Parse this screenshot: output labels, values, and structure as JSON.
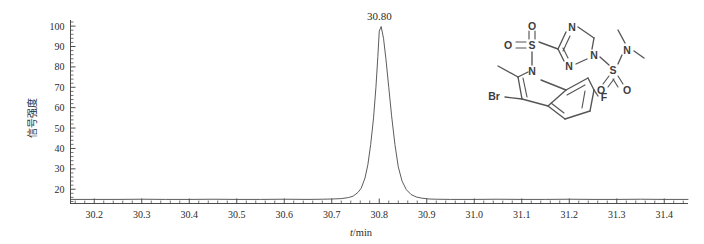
{
  "chart_data": {
    "type": "line",
    "title": "",
    "xlabel": "t/min",
    "ylabel": "信号强度",
    "xlim": [
      30.15,
      31.45
    ],
    "ylim": [
      13,
      103
    ],
    "xticks": [
      "30.2",
      "30.3",
      "30.4",
      "30.5",
      "30.6",
      "30.7",
      "30.8",
      "30.9",
      "31.0",
      "31.1",
      "31.2",
      "31.3",
      "31.4"
    ],
    "xtick_values": [
      30.2,
      30.3,
      30.4,
      30.5,
      30.6,
      30.7,
      30.8,
      30.9,
      31.0,
      31.1,
      31.2,
      31.3,
      31.4
    ],
    "yticks": [
      "20",
      "30",
      "40",
      "50",
      "60",
      "70",
      "80",
      "90",
      "100"
    ],
    "ytick_values": [
      20,
      30,
      40,
      50,
      60,
      70,
      80,
      90,
      100
    ],
    "minor_ticks_per_interval": 5,
    "grid": false,
    "legend": null,
    "annotations": [
      {
        "text": "30.80",
        "x": 30.8,
        "y": 100
      }
    ],
    "peaks": [
      {
        "retention_time": 30.8,
        "height": 100,
        "label": "30.80"
      }
    ],
    "baseline": 15,
    "series": [
      {
        "name": "signal",
        "x": [
          30.15,
          30.2,
          30.25,
          30.3,
          30.35,
          30.4,
          30.45,
          30.5,
          30.55,
          30.6,
          30.65,
          30.68,
          30.7,
          30.72,
          30.735,
          30.745,
          30.755,
          30.762,
          30.77,
          30.776,
          30.782,
          30.788,
          30.793,
          30.797,
          30.8,
          30.804,
          30.809,
          30.814,
          30.82,
          30.826,
          30.833,
          30.84,
          30.848,
          30.857,
          30.867,
          30.878,
          30.89,
          30.905,
          30.92,
          30.95,
          31.0,
          31.05,
          31.1,
          31.15,
          31.2,
          31.25,
          31.3,
          31.35,
          31.4,
          31.45
        ],
        "y": [
          15.0,
          15.0,
          15.0,
          15.1,
          15.0,
          15.0,
          15.1,
          15.0,
          15.0,
          15.1,
          15.0,
          15.1,
          15.2,
          15.4,
          15.9,
          16.6,
          18.4,
          20.5,
          25.5,
          32.0,
          42.0,
          55.0,
          70.0,
          85.0,
          97.5,
          99.8,
          94.0,
          84.0,
          70.0,
          56.0,
          42.0,
          31.0,
          24.0,
          19.8,
          17.4,
          16.2,
          15.6,
          15.2,
          15.1,
          15.0,
          15.0,
          15.1,
          15.0,
          15.0,
          15.1,
          15.0,
          15.0,
          15.1,
          15.0,
          15.0
        ]
      }
    ]
  },
  "structure": {
    "name": "chemical-structure-diagram",
    "description": "3-bromo-6-fluoro-2-methylindole-1-sulfonyl triazole N,N-dimethylsulfamide",
    "atoms": [
      {
        "label": "Br",
        "x": 24,
        "y": 78
      },
      {
        "label": "N",
        "x": 62,
        "y": 53
      },
      {
        "label": "S",
        "x": 62,
        "y": 27
      },
      {
        "label": "O",
        "x": 38,
        "y": 27
      },
      {
        "label": "O",
        "x": 62,
        "y": 8
      },
      {
        "label": "N",
        "x": 102,
        "y": 9
      },
      {
        "label": "N",
        "x": 99,
        "y": 48
      },
      {
        "label": "N",
        "x": 124,
        "y": 37
      },
      {
        "label": "S",
        "x": 143,
        "y": 52
      },
      {
        "label": "O",
        "x": 131,
        "y": 72
      },
      {
        "label": "O",
        "x": 157,
        "y": 72
      },
      {
        "label": "N",
        "x": 157,
        "y": 32
      },
      {
        "label": "F",
        "x": 134,
        "y": 79
      }
    ]
  }
}
